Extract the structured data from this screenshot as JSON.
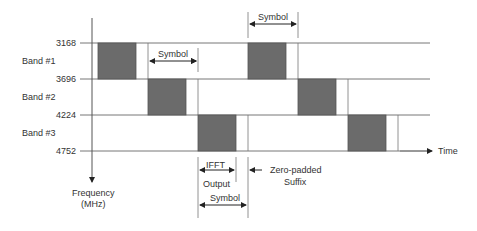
{
  "diagram": {
    "y_axis": {
      "label_line1": "Frequency",
      "label_line2": "(MHz)"
    },
    "x_axis": {
      "label": "Time"
    },
    "frequency_ticks": [
      "3168",
      "3696",
      "4224",
      "4752"
    ],
    "bands": [
      {
        "label": "Band #1"
      },
      {
        "label": "Band #2"
      },
      {
        "label": "Band #3"
      }
    ],
    "annotations": {
      "symbol_top": "Symbol",
      "symbol_band1": "Symbol",
      "ifft_line1": "IFFT",
      "ifft_line2": "Output",
      "symbol_bottom": "Symbol",
      "zero_padded_line1": "Zero-padded",
      "zero_padded_line2": "Suffix"
    },
    "colors": {
      "block": "#6b6b6b",
      "line": "#555555",
      "text": "#333333"
    }
  }
}
